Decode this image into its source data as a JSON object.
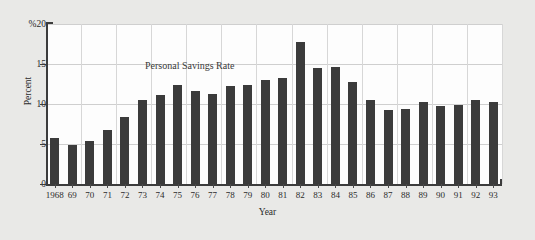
{
  "chart_data": {
    "type": "bar",
    "title": "",
    "annotation": "Personal Savings Rate",
    "xlabel": "Year",
    "ylabel": "Percent",
    "y_unit_label": "%",
    "ylim": [
      0,
      20
    ],
    "yticks": [
      0,
      5,
      10,
      15,
      20
    ],
    "ytick_labels": [
      "0",
      "5",
      "10",
      "15",
      "%20"
    ],
    "grid": true,
    "grid_axis": "both",
    "legend": "none",
    "categories": [
      "1968",
      "69",
      "70",
      "71",
      "72",
      "73",
      "74",
      "75",
      "76",
      "77",
      "78",
      "79",
      "80",
      "81",
      "82",
      "83",
      "84",
      "85",
      "86",
      "87",
      "88",
      "89",
      "90",
      "91",
      "92",
      "93"
    ],
    "values": [
      5.8,
      4.9,
      5.4,
      6.8,
      8.4,
      10.5,
      11.1,
      12.4,
      11.6,
      11.2,
      12.2,
      12.4,
      13.0,
      13.3,
      17.8,
      14.5,
      14.6,
      12.8,
      10.5,
      9.2,
      9.4,
      10.2,
      9.8,
      9.9,
      10.5,
      10.2
    ],
    "series_name": "Personal Savings Rate",
    "bar_color": "#3b3b3b",
    "panel_color": "#fdfdfd",
    "page_color": "#e9e9e7",
    "grid_color": "#d7d7d7",
    "axis_color": "#3c3c3c"
  }
}
